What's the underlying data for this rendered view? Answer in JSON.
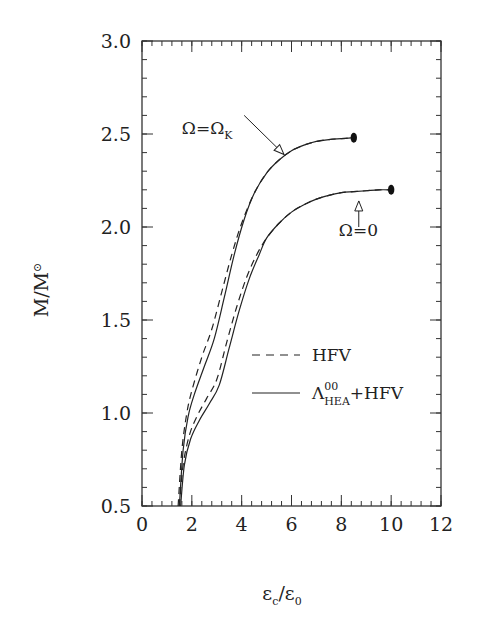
{
  "chart_data": {
    "type": "line",
    "title": "",
    "xlabel": {
      "main": "ε",
      "sub": "c",
      "sep": "/",
      "main2": "ε",
      "sub2": "0"
    },
    "ylabel": {
      "main": "M/M",
      "sub": "⊙"
    },
    "xlim": [
      0,
      12
    ],
    "ylim": [
      0.5,
      3.0
    ],
    "xticks": [
      0,
      2,
      4,
      6,
      8,
      10,
      12
    ],
    "xtick_labels": [
      "0",
      "2",
      "4",
      "6",
      "8",
      "10",
      "12"
    ],
    "yticks": [
      0.5,
      1.0,
      1.5,
      2.0,
      2.5,
      3.0
    ],
    "ytick_labels": [
      "0.5",
      "1.0",
      "1.5",
      "2.0",
      "2.5",
      "3.0"
    ],
    "x_minor_step": 0.4,
    "y_minor_step": 0.1,
    "grid": false,
    "legend": {
      "placement": "center-right",
      "entries": [
        {
          "style": "dashed",
          "label": "HFV"
        },
        {
          "style": "solid",
          "label_main": "Λ",
          "label_sup": "00",
          "label_sub": "HEA",
          "label_tail": "+HFV"
        }
      ]
    },
    "series": [
      {
        "name": "HFV, Ω=Ω_K",
        "style": "dashed",
        "x": [
          1.45,
          1.6,
          1.8,
          2.0,
          2.4,
          2.8,
          3.2,
          3.6,
          4.0,
          4.5,
          5.0,
          5.5,
          6.0,
          6.5,
          7.0,
          7.5,
          8.0,
          8.5
        ],
        "y": [
          0.5,
          0.8,
          1.0,
          1.12,
          1.3,
          1.45,
          1.65,
          1.85,
          2.02,
          2.18,
          2.29,
          2.36,
          2.41,
          2.44,
          2.46,
          2.47,
          2.475,
          2.48
        ]
      },
      {
        "name": "Λ_HEA^00+HFV, Ω=Ω_K",
        "style": "solid",
        "x": [
          1.5,
          1.65,
          1.85,
          2.1,
          2.5,
          2.9,
          3.3,
          3.7,
          4.1,
          4.5,
          5.0,
          5.5,
          6.0,
          6.5,
          7.0,
          7.5,
          8.0,
          8.5
        ],
        "y": [
          0.5,
          0.8,
          0.98,
          1.1,
          1.25,
          1.4,
          1.62,
          1.85,
          2.04,
          2.18,
          2.29,
          2.36,
          2.41,
          2.44,
          2.46,
          2.47,
          2.475,
          2.48
        ]
      },
      {
        "name": "HFV, Ω=0",
        "style": "dashed",
        "x": [
          1.5,
          1.65,
          1.9,
          2.2,
          2.6,
          3.0,
          3.4,
          3.8,
          4.2,
          4.6,
          5.0,
          5.5,
          6.0,
          6.5,
          7.0,
          7.5,
          8.0,
          8.5,
          9.0,
          9.5,
          10.0
        ],
        "y": [
          0.5,
          0.72,
          0.88,
          0.98,
          1.08,
          1.18,
          1.38,
          1.57,
          1.73,
          1.85,
          1.94,
          2.02,
          2.08,
          2.12,
          2.15,
          2.17,
          2.185,
          2.19,
          2.195,
          2.2,
          2.2
        ]
      },
      {
        "name": "Λ_HEA^00+HFV, Ω=0",
        "style": "solid",
        "x": [
          1.55,
          1.7,
          1.95,
          2.3,
          2.7,
          3.1,
          3.5,
          3.9,
          4.3,
          4.7,
          5.0,
          5.5,
          6.0,
          6.5,
          7.0,
          7.5,
          8.0,
          8.5,
          9.0,
          9.5,
          10.0
        ],
        "y": [
          0.5,
          0.72,
          0.86,
          0.96,
          1.05,
          1.15,
          1.35,
          1.55,
          1.72,
          1.85,
          1.94,
          2.02,
          2.08,
          2.12,
          2.15,
          2.17,
          2.185,
          2.19,
          2.195,
          2.2,
          2.2
        ]
      }
    ],
    "endpoints": [
      {
        "x": 8.5,
        "y": 2.48
      },
      {
        "x": 10.0,
        "y": 2.2
      }
    ],
    "annotations": [
      {
        "text_main": "Ω=Ω",
        "text_sub": "K",
        "label_at": [
          1.6,
          2.5
        ],
        "arrow_from": [
          4.1,
          2.6
        ],
        "arrow_to": [
          5.7,
          2.39
        ]
      },
      {
        "text": "Ω=0",
        "label_at": [
          7.9,
          1.95
        ],
        "arrow_from": [
          8.7,
          2.0
        ],
        "arrow_to": [
          8.7,
          2.14
        ]
      }
    ]
  }
}
